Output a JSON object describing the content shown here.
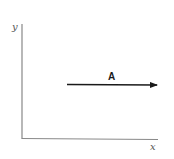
{
  "diagram": {
    "axes": {
      "x_label": "x",
      "y_label": "y",
      "color": "#888888"
    },
    "vectors": [
      {
        "label": "A",
        "direction": "positive-x",
        "color": "#1a1a1a"
      }
    ]
  }
}
